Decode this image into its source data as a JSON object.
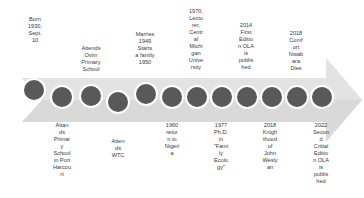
{
  "diagram": {
    "type": "timeline-arrow",
    "colors": {
      "arrow": "#d9d9d9",
      "dot": "#595959",
      "dot_border": "#ffffff",
      "text": "#3a3a3a"
    },
    "events": [
      {
        "id": 1,
        "label": "Born\n1930,\nSept.\n10",
        "position": "top"
      },
      {
        "id": 2,
        "label": "Attan\nds\nPrimar\ny\nSchool\nin Port\nHarcou\nrt",
        "position": "bottom"
      },
      {
        "id": 3,
        "label": "Attends\nOvim\nPrimary\nSchool",
        "position": "top"
      },
      {
        "id": 4,
        "label": "Atten\nds\nWTC",
        "position": "bottom"
      },
      {
        "id": 5,
        "label": "Marries\n1949\nStarts\na family\n1950",
        "position": "top"
      },
      {
        "id": 6,
        "label": "1960\nretur\nn to\nNigeri\na",
        "position": "bottom"
      },
      {
        "id": 7,
        "label": "1970,\nLectu\nrer,\nCentr\nal\nMichi\ngan\nUnive\nrsity",
        "position": "top"
      },
      {
        "id": 8,
        "label": "1977\nPh.D.\nin\n\"Fami\nly\nEcolo\ngy\"",
        "position": "bottom"
      },
      {
        "id": 9,
        "label": "2014\nFirst\nEditio\nn OLA\nis\npublis\nhed",
        "position": "top"
      },
      {
        "id": 10,
        "label": "2018\nKnigh\nthood\nof\nJohn\nWesly\nan",
        "position": "bottom"
      },
      {
        "id": 11,
        "label": "2018\nComf\nort\nNwab\nara\nDies",
        "position": "top"
      },
      {
        "id": 12,
        "label": "2022\nSecon\nd\nCritial\nEditio\nn OLA\nis\npublis\nhed",
        "position": "bottom"
      }
    ]
  }
}
